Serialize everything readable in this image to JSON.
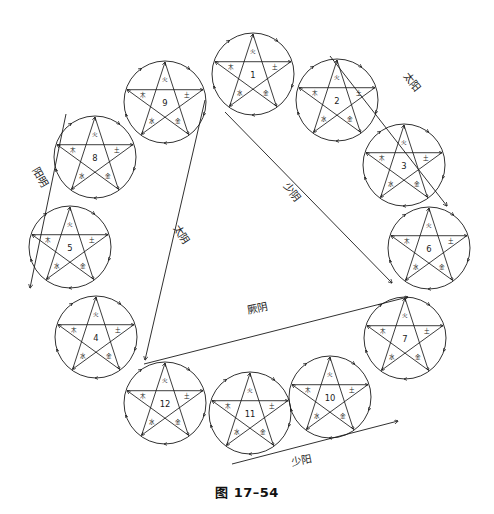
{
  "figure": {
    "caption": "图 17–54",
    "background_color": "#ffffff",
    "line_color": "#1a1a1a"
  },
  "elements": {
    "fire": "火",
    "wood": "木",
    "earth": "土",
    "water": "水",
    "metal": "金"
  },
  "circles": [
    {
      "id": "circle-1",
      "number": "1",
      "cx": 253,
      "cy": 74,
      "r": 41
    },
    {
      "id": "circle-2",
      "number": "2",
      "cx": 337,
      "cy": 100,
      "r": 41
    },
    {
      "id": "circle-3",
      "number": "3",
      "cx": 404,
      "cy": 165,
      "r": 41
    },
    {
      "id": "circle-4",
      "number": "4",
      "cx": 96,
      "cy": 337,
      "r": 41
    },
    {
      "id": "circle-5",
      "number": "5",
      "cx": 70,
      "cy": 247,
      "r": 41
    },
    {
      "id": "circle-6",
      "number": "6",
      "cx": 429,
      "cy": 248,
      "r": 41
    },
    {
      "id": "circle-7",
      "number": "7",
      "cx": 405,
      "cy": 338,
      "r": 41
    },
    {
      "id": "circle-8",
      "number": "8",
      "cx": 95,
      "cy": 157,
      "r": 41
    },
    {
      "id": "circle-9",
      "number": "9",
      "cx": 165,
      "cy": 102,
      "r": 41
    },
    {
      "id": "circle-10",
      "number": "10",
      "cx": 330,
      "cy": 397,
      "r": 41
    },
    {
      "id": "circle-11",
      "number": "11",
      "cx": 250,
      "cy": 413,
      "r": 41
    },
    {
      "id": "circle-12",
      "number": "12",
      "cx": 165,
      "cy": 403,
      "r": 41
    }
  ],
  "meridians": [
    {
      "id": "meridian-taiyang",
      "label": "太阳",
      "lx": 409,
      "ly": 84,
      "rot": 52,
      "x1": 330,
      "y1": 56,
      "x2": 447,
      "y2": 206
    },
    {
      "id": "meridian-shaoyin",
      "label": "少阴",
      "lx": 289,
      "ly": 194,
      "rot": 52,
      "x1": 225,
      "y1": 112,
      "x2": 392,
      "y2": 283
    },
    {
      "id": "meridian-taiyin",
      "label": "太阴",
      "lx": 178,
      "ly": 236,
      "rot": 57,
      "x1": 205,
      "y1": 100,
      "x2": 145,
      "y2": 360
    },
    {
      "id": "meridian-yangming",
      "label": "阳明",
      "lx": 37,
      "ly": 179,
      "rot": 60,
      "x1": 66,
      "y1": 114,
      "x2": 30,
      "y2": 288
    },
    {
      "id": "meridian-jueyin",
      "label": "厥阴",
      "lx": 258,
      "ly": 312,
      "rot": 348,
      "x1": 144,
      "y1": 364,
      "x2": 408,
      "y2": 297
    },
    {
      "id": "meridian-shaoyang",
      "label": "少阳",
      "lx": 302,
      "ly": 464,
      "rot": 349,
      "x1": 232,
      "y1": 464,
      "x2": 398,
      "y2": 421
    }
  ]
}
